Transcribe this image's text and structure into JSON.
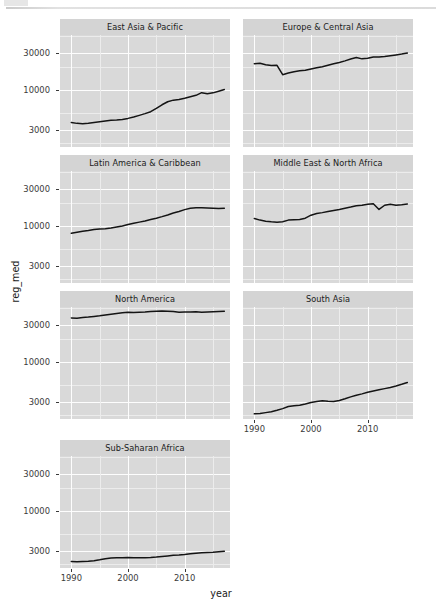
{
  "chart_data": {
    "type": "line",
    "title": "",
    "xlabel": "year",
    "ylabel": "reg_med",
    "facet_layout": "2 columns x 4 rows, free panel strips (ggplot2 facet_wrap)",
    "y_scale": "log",
    "ylim": [
      1800,
      52000
    ],
    "xlim": [
      1988,
      2018
    ],
    "grid": true,
    "legend": "none",
    "y_ticks": [
      3000,
      10000,
      30000
    ],
    "y_tick_labels": [
      "3000",
      "10000",
      "30000"
    ],
    "x_ticks": [
      1990,
      2000,
      2010
    ],
    "x_tick_labels": [
      "1990",
      "2000",
      "2010"
    ],
    "x": [
      1990,
      1991,
      1992,
      1993,
      1994,
      1995,
      1996,
      1997,
      1998,
      1999,
      2000,
      2001,
      2002,
      2003,
      2004,
      2005,
      2006,
      2007,
      2008,
      2009,
      2010,
      2011,
      2012,
      2013,
      2014,
      2015,
      2016,
      2017
    ],
    "series": [
      {
        "name": "East Asia & Pacific",
        "values": [
          3750,
          3660,
          3630,
          3680,
          3760,
          3850,
          3930,
          4010,
          4050,
          4120,
          4250,
          4420,
          4650,
          4900,
          5200,
          5750,
          6400,
          7000,
          7350,
          7500,
          7800,
          8150,
          8500,
          9200,
          8900,
          9150,
          9600,
          10100
        ]
      },
      {
        "name": "Europe & Central Asia",
        "values": [
          22000,
          22200,
          21300,
          20800,
          20900,
          15800,
          16600,
          17300,
          17800,
          18000,
          18700,
          19400,
          20100,
          21000,
          21900,
          22800,
          23900,
          25300,
          26500,
          25400,
          25800,
          26800,
          26900,
          27300,
          27900,
          28600,
          29300,
          30200
        ]
      },
      {
        "name": "Latin America & Caribbean",
        "values": [
          8000,
          8250,
          8500,
          8700,
          8950,
          9100,
          9200,
          9400,
          9700,
          10000,
          10400,
          10800,
          11200,
          11600,
          12100,
          12600,
          13200,
          13900,
          14700,
          15400,
          16300,
          17000,
          17200,
          17200,
          17150,
          17050,
          16900,
          17000
        ]
      },
      {
        "name": "Middle East & North Africa",
        "values": [
          12500,
          11900,
          11500,
          11300,
          11200,
          11300,
          11900,
          12000,
          12100,
          12600,
          13800,
          14500,
          14900,
          15400,
          15900,
          16400,
          17000,
          17600,
          18300,
          18600,
          19200,
          19500,
          16400,
          18600,
          19100,
          18600,
          18900,
          19300
        ]
      },
      {
        "name": "North America",
        "values": [
          37500,
          37200,
          37800,
          38400,
          39200,
          39900,
          40800,
          41800,
          42800,
          43600,
          44300,
          44100,
          44400,
          44800,
          45400,
          45900,
          46100,
          45900,
          45300,
          44400,
          44600,
          44900,
          45100,
          44300,
          44700,
          45100,
          45400,
          45700
        ]
      },
      {
        "name": "South Asia",
        "values": [
          2100,
          2120,
          2180,
          2240,
          2340,
          2460,
          2620,
          2680,
          2720,
          2820,
          2950,
          3050,
          3120,
          3060,
          3040,
          3130,
          3300,
          3500,
          3680,
          3830,
          4020,
          4180,
          4320,
          4480,
          4650,
          4850,
          5100,
          5400
        ]
      },
      {
        "name": "Sub-Saharan Africa",
        "values": [
          2180,
          2170,
          2190,
          2210,
          2240,
          2300,
          2380,
          2430,
          2440,
          2450,
          2460,
          2450,
          2440,
          2450,
          2470,
          2500,
          2540,
          2590,
          2640,
          2660,
          2700,
          2760,
          2810,
          2840,
          2870,
          2890,
          2930,
          2980
        ]
      }
    ]
  },
  "panels": [
    {
      "title": "East Asia & Pacific"
    },
    {
      "title": "Europe & Central Asia"
    },
    {
      "title": "Latin America & Caribbean"
    },
    {
      "title": "Middle East & North Africa"
    },
    {
      "title": "North America"
    },
    {
      "title": "South Asia"
    },
    {
      "title": "Sub-Saharan Africa"
    }
  ],
  "axes": {
    "y_title": "reg_med",
    "x_title": "year",
    "y_tick_labels": [
      "30000",
      "10000",
      "3000"
    ],
    "x_tick_labels": [
      "1990",
      "2000",
      "2010"
    ]
  },
  "colors": {
    "panel_background": "#d9d9d9",
    "strip_background": "#d4d4d4",
    "gridline_major": "#fdfdfd",
    "gridline_minor": "#ececec",
    "line": "#141414",
    "text": "#1b1b1b",
    "axis_text": "#3a3a3a",
    "page_background": "#ffffff"
  }
}
